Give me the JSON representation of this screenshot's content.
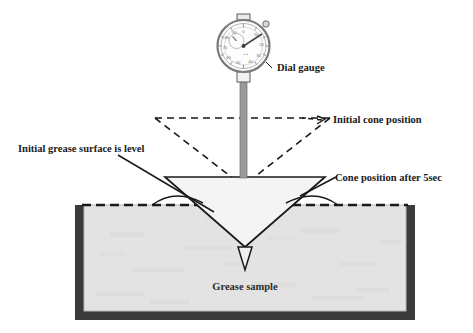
{
  "figure": {
    "background_color": "#ffffff"
  },
  "labels": {
    "dial_gauge": "Dial gauge",
    "initial_cone_position": "Initial cone position",
    "initial_grease_surface": "Initial grease surface is level",
    "cone_position_after": "Cone position after 5sec",
    "grease_sample": "Grease sample"
  },
  "dial_gauge": {
    "face_numbers": [
      "0",
      "10",
      "20",
      "30",
      "40",
      "50",
      "60",
      "70",
      "80",
      "90"
    ],
    "needle_reading": "12",
    "has_inner_counter_dial": true,
    "bezel_color": "#7a7a7a",
    "face_color": "#fdfdfd"
  },
  "colors": {
    "outline": "#1a1a1a",
    "container_wall": "#3a3a3a",
    "grease_fill": "#e3e3e3",
    "cone_fill": "#f4f4f4",
    "shaft": "#9a9a9a",
    "dashed": "#1a1a1a"
  },
  "geometry": {
    "container_left": 75,
    "container_right": 415,
    "container_top": 205,
    "container_bottom": 320,
    "grease_surface_y": 205,
    "cone_top_y": 177,
    "cone_tip_y": 262,
    "initial_cone_top_y": 118
  }
}
